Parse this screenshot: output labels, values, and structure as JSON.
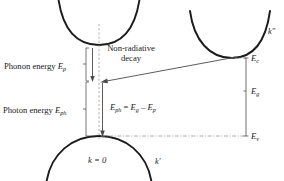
{
  "figure": {
    "type": "band-diagram",
    "background_color": "#ffffff",
    "curve_color": "#1b1b1b",
    "guide_color": "#9a9a9a",
    "arrow_color": "#4a4a4a"
  },
  "labels": {
    "phonon_energy": "Phonon energy",
    "phonon_energy_symbol": "E",
    "phonon_energy_subscript": "p",
    "photon_energy": "Photon energy",
    "photon_energy_symbol": "E",
    "photon_energy_subscript": "ph",
    "non_radiative_line1": "Non-radiative",
    "non_radiative_line2": "decay",
    "k_zero": "k = 0",
    "k_prime": "k′",
    "k_double_prime": "k″"
  },
  "equation": {
    "lhs_symbol": "E",
    "lhs_subscript": "ph",
    "equals": "=",
    "term1_symbol": "E",
    "term1_subscript": "g",
    "minus": "–",
    "term2_symbol": "E",
    "term2_subscript": "p",
    "full_text": "Eph = Eg – Ep"
  },
  "energy_levels": [
    {
      "id": "Ec",
      "symbol": "E",
      "subscript": "c",
      "name": "conduction-band-edge"
    },
    {
      "id": "Eg",
      "symbol": "E",
      "subscript": "g",
      "name": "bandgap-energy"
    },
    {
      "id": "Ev",
      "symbol": "E",
      "subscript": "v",
      "name": "valence-band-edge"
    }
  ],
  "bands": [
    {
      "name": "conduction-band-direct",
      "shape": "parabola-up",
      "vertex_k": "k = 0"
    },
    {
      "name": "conduction-band-indirect",
      "shape": "parabola-up",
      "vertex_k": "k″"
    },
    {
      "name": "valence-band",
      "shape": "parabola-down",
      "vertex_k": "k = 0"
    }
  ],
  "arrows": [
    {
      "name": "phonon-emission-arrow",
      "direction": "down"
    },
    {
      "name": "photon-emission-arrow",
      "direction": "down"
    },
    {
      "name": "non-radiative-decay-arrow",
      "direction": "left-down"
    }
  ]
}
